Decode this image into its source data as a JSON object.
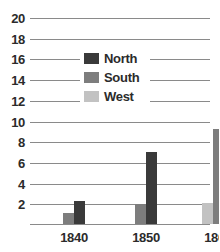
{
  "chart_data": {
    "type": "bar",
    "title": "",
    "subtitle": "",
    "xlabel": "",
    "ylabel": "",
    "categories": [
      "1840",
      "1850",
      "1860"
    ],
    "series": [
      {
        "name": "North",
        "color": "#3a3a3a",
        "values": [
          2.2,
          7.0,
          19.4
        ]
      },
      {
        "name": "South",
        "color": "#7d7d7d",
        "values": [
          1.1,
          1.9,
          9.2
        ]
      },
      {
        "name": "West",
        "color": "#c2c2c2",
        "values": [
          null,
          null,
          2.0
        ]
      }
    ],
    "ylim": [
      0,
      20
    ],
    "yticks": [
      2,
      4,
      6,
      8,
      10,
      12,
      14,
      16,
      18,
      20
    ],
    "ytick_labels": [
      "2",
      "4",
      "6",
      "8",
      "10",
      "12",
      "14",
      "16",
      "18",
      "20"
    ],
    "grid": true,
    "legend_position": "center",
    "legend_entries": [
      "North",
      "South",
      "West"
    ],
    "annotations": []
  },
  "axes": {
    "y_labels": [
      "20",
      "18",
      "16",
      "14",
      "12",
      "10",
      "8",
      "6",
      "4",
      "2"
    ],
    "x_labels": [
      "1840",
      "1850",
      "1860"
    ]
  },
  "legend": {
    "rows": [
      {
        "label": "North",
        "color": "#3a3a3a"
      },
      {
        "label": "South",
        "color": "#7d7d7d"
      },
      {
        "label": "West",
        "color": "#c2c2c2"
      }
    ]
  },
  "colors": {
    "north": "#3a3a3a",
    "south": "#7d7d7d",
    "west": "#c2c2c2",
    "grid": "#8a8a8a",
    "text": "#2b2b2b",
    "background": "#ffffff"
  }
}
